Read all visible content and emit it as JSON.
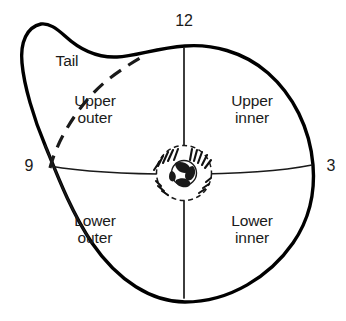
{
  "diagram": {
    "outline_color": "#000000",
    "line_color": "#1a1a1a",
    "text_color": "#1a1a1a",
    "background_color": "#ffffff",
    "quadrants": [
      {
        "id": "upper-outer",
        "line1": "Upper",
        "line2": "outer"
      },
      {
        "id": "upper-inner",
        "line1": "Upper",
        "line2": "inner"
      },
      {
        "id": "lower-outer",
        "line1": "Lower",
        "line2": "outer"
      },
      {
        "id": "lower-inner",
        "line1": "Lower",
        "line2": "inner"
      }
    ],
    "regions": [
      {
        "id": "tail",
        "label": "Tail"
      }
    ],
    "clock_markers": [
      {
        "id": "twelve",
        "label": "12",
        "position": "top"
      },
      {
        "id": "three",
        "label": "3",
        "position": "right"
      },
      {
        "id": "nine",
        "label": "9",
        "position": "left"
      }
    ],
    "center": {
      "id": "nipple-areola",
      "label": ""
    }
  }
}
